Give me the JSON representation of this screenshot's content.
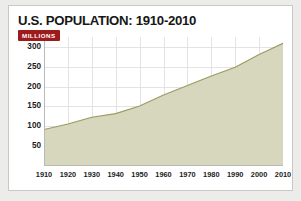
{
  "card": {
    "title": "U.S. POPULATION: 1910-2010",
    "units_badge": "MILLIONS"
  },
  "colors": {
    "badge_bg": "#9e1b1b",
    "badge_text": "#ffffff",
    "area_fill": "#d6d7bd",
    "area_line": "#9a9a63",
    "gridline": "#e3e3e3",
    "axis": "#b9b9b9",
    "card_bg": "#ffffff",
    "card_border": "#c9c9c4",
    "page_bg": "#ececeb",
    "text": "#171717"
  },
  "chart_data": {
    "type": "area",
    "title": "U.S. POPULATION: 1910-2010",
    "xlabel": "",
    "ylabel": "MILLIONS",
    "xlim": [
      1910,
      2010
    ],
    "ylim": [
      0,
      325
    ],
    "grid": true,
    "legend": "none",
    "categories": [
      1910,
      1920,
      1930,
      1940,
      1950,
      1960,
      1970,
      1980,
      1990,
      2000,
      2010
    ],
    "xticklabels": [
      "1910",
      "1920",
      "1930",
      "1940",
      "1950",
      "1960",
      "1970",
      "1980",
      "1990",
      "2000",
      "2010"
    ],
    "yticks": [
      50,
      100,
      150,
      200,
      250,
      300
    ],
    "yticklabels": [
      "50",
      "100",
      "150",
      "200",
      "250",
      "300"
    ],
    "series": [
      {
        "name": "U.S. Population (millions)",
        "values": [
          92,
          106,
          123,
          132,
          151,
          179,
          203,
          227,
          249,
          281,
          309
        ]
      }
    ]
  }
}
